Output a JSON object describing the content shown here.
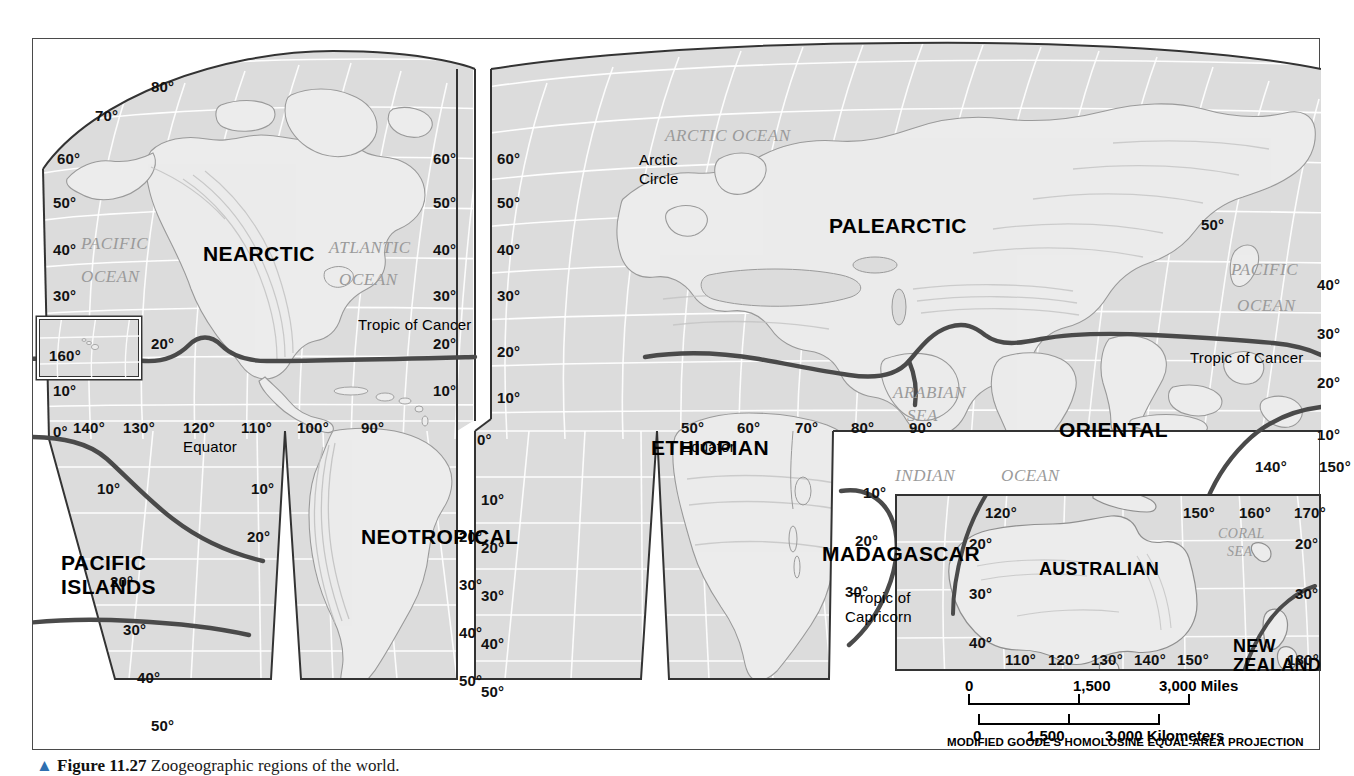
{
  "figure": {
    "caption_arrow": "▲",
    "caption_number": "Figure 11.27",
    "caption_text": "Zoogeographic regions of the world."
  },
  "map": {
    "projection_note": "MODIFIED GOODE'S HOMOLOSINE EQUAL-AREA PROJECTION",
    "regions": [
      {
        "name": "NEARCTIC"
      },
      {
        "name": "NEOTROPICAL"
      },
      {
        "name": "PACIFIC ISLANDS"
      },
      {
        "name": "PALEARCTIC"
      },
      {
        "name": "ETHIOPIAN"
      },
      {
        "name": "ORIENTAL"
      },
      {
        "name": "MADAGASCAR"
      },
      {
        "name": "AUSTRALIAN"
      },
      {
        "name": "NEW ZEALAND"
      }
    ],
    "oceans": [
      {
        "line1": "PACIFIC",
        "line2": "OCEAN"
      },
      {
        "line1": "ATLANTIC",
        "line2": "OCEAN"
      },
      {
        "line1": "ARCTIC OCEAN"
      },
      {
        "line1": "ARABIAN",
        "line2": "SEA"
      },
      {
        "line1": "INDIAN"
      },
      {
        "line1": "OCEAN"
      },
      {
        "line1": "PACIFIC",
        "line2": "OCEAN"
      },
      {
        "line1": "CORAL",
        "line2": "SEA"
      }
    ],
    "annotations": {
      "arctic_circle_l1": "Arctic",
      "arctic_circle_l2": "Circle",
      "equator": "Equator",
      "tropic_of_cancer": "Tropic of Cancer",
      "tropic_of_capricorn_l1": "Tropic of",
      "tropic_of_capricorn_l2": "Capricorn"
    },
    "labels": {
      "west_lobe": {
        "lat_left": [
          "80°",
          "70°",
          "60°",
          "50°",
          "40°",
          "30°",
          "20°",
          "10°",
          "0°"
        ],
        "lat_left_south": [
          "10°",
          "20°",
          "30°",
          "40°",
          "50°"
        ],
        "lat_right_north": [
          "60°",
          "50°",
          "40°",
          "30°",
          "20°",
          "10°"
        ],
        "lat_right_south": [
          "10°",
          "20°",
          "30°",
          "40°",
          "50°"
        ],
        "lon_equator": [
          "140°",
          "130°",
          "120°",
          "110°",
          "100°",
          "90°"
        ],
        "hawaii_box": "160°"
      },
      "east_lobe": {
        "lat_left": [
          "60°",
          "50°",
          "40°",
          "30°",
          "20°",
          "10°",
          "0°"
        ],
        "lat_left_south": [
          "10°",
          "20°",
          "30°",
          "40°",
          "50°"
        ],
        "lat_right_north": [
          "50°",
          "40°",
          "30°",
          "20°",
          "10°"
        ],
        "lon_equator": [
          "50°",
          "60°",
          "70°",
          "80°",
          "90°"
        ],
        "lon_right": [
          "140°",
          "150°"
        ],
        "lat_mid_south": [
          "10°",
          "20°",
          "30°"
        ]
      },
      "australia_inset": {
        "lon_top": [
          "120°",
          "150°",
          "160°",
          "170°"
        ],
        "lat_left": [
          "20°",
          "30°",
          "40°"
        ],
        "lat_right": [
          "20°",
          "30°"
        ],
        "lon_bottom": [
          "110°",
          "120°",
          "130°",
          "140°",
          "150°",
          "180°"
        ]
      }
    },
    "scale_miles": {
      "start": "0",
      "mid": "1,500",
      "end": "3,000 Miles"
    },
    "scale_km": {
      "start": "0",
      "mid": "1,500",
      "end": "3,000 Kilometers"
    }
  },
  "colors": {
    "land": "#e8e8e8",
    "sea": "#dcdcdc",
    "graticule": "#ffffff",
    "coast": "#8f8f8f",
    "boundary": "#4a4a4a",
    "text": "#000000",
    "ocean_label": "#9a9a9a"
  }
}
